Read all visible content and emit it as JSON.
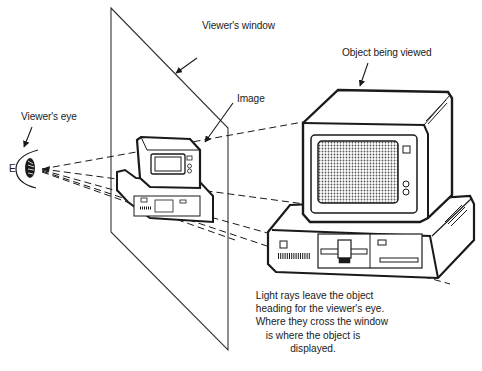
{
  "diagram": {
    "type": "perspective-projection-illustration",
    "labels": {
      "viewers_window": "Viewer's window",
      "object_being_viewed": "Object being viewed",
      "image": "Image",
      "viewers_eye": "Viewer's eye",
      "eye_marker": "E"
    },
    "caption_lines": [
      "Light rays leave the object",
      "heading for the viewer's eye.",
      "Where they cross the window",
      "is where the object is",
      "displayed."
    ],
    "colors": {
      "ink": "#1a1a1a",
      "background": "#ffffff",
      "screen_fill": "#b8b8b8"
    }
  }
}
